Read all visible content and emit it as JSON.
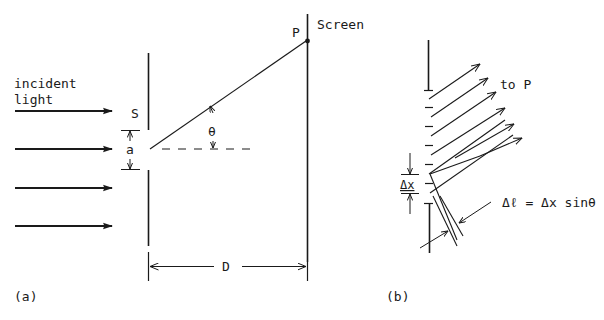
{
  "panel_a": {
    "label": "(a)",
    "incident_label_line1": "incident",
    "incident_label_line2": "light",
    "slit_label": "S",
    "slit_width_label": "a",
    "angle_label": "θ",
    "point_label": "P",
    "screen_label": "Screen",
    "distance_label": "D",
    "incident_arrow_count": 4
  },
  "panel_b": {
    "label": "(b)",
    "direction_label": "to P",
    "element_width_label": "Δx",
    "path_difference_equation": "Δℓ = Δx sinθ",
    "ray_count": 6
  },
  "colors": {
    "ink": "#1a1a1a",
    "background": "#ffffff"
  }
}
